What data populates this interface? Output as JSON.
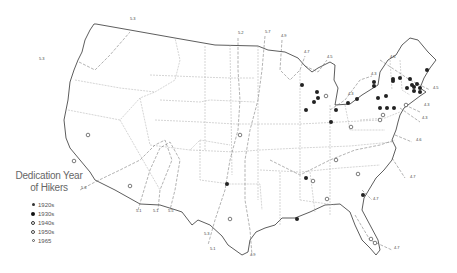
{
  "map": {
    "subject": "Contiguous United States",
    "colors": {
      "coast": "#333333",
      "state": "#999999",
      "isoline": "#666666",
      "marker": "#222222"
    }
  },
  "legend": {
    "title_line1": "Dedication Year",
    "title_line2": "of Hikers",
    "items": [
      {
        "label": "1920s",
        "symbol": "small-filled"
      },
      {
        "label": "1930s",
        "symbol": "filled"
      },
      {
        "label": "1940s",
        "symbol": "ring-thick"
      },
      {
        "label": "1950s",
        "symbol": "ring"
      },
      {
        "label": "1965",
        "symbol": "ring-small"
      }
    ]
  },
  "isoline_labels": [
    {
      "text": "5.3",
      "x": 39,
      "y": 60
    },
    {
      "text": "5.3",
      "x": 130,
      "y": 20
    },
    {
      "text": "5.2",
      "x": 238,
      "y": 34
    },
    {
      "text": "5.7",
      "x": 265,
      "y": 33
    },
    {
      "text": "4.9",
      "x": 281,
      "y": 37
    },
    {
      "text": "4.7",
      "x": 304,
      "y": 53
    },
    {
      "text": "4.5",
      "x": 327,
      "y": 58
    },
    {
      "text": "4.5",
      "x": 390,
      "y": 58
    },
    {
      "text": "4.3",
      "x": 371,
      "y": 75
    },
    {
      "text": "4.5",
      "x": 433,
      "y": 89
    },
    {
      "text": "4.3",
      "x": 348,
      "y": 95
    },
    {
      "text": "4.3",
      "x": 424,
      "y": 106
    },
    {
      "text": "4.3",
      "x": 422,
      "y": 119
    },
    {
      "text": "4.6",
      "x": 416,
      "y": 141
    },
    {
      "text": "4.7",
      "x": 410,
      "y": 178
    },
    {
      "text": "4.7",
      "x": 373,
      "y": 200
    },
    {
      "text": "4.7",
      "x": 394,
      "y": 249
    },
    {
      "text": "4.9",
      "x": 250,
      "y": 256
    },
    {
      "text": "5.3",
      "x": 81,
      "y": 189
    },
    {
      "text": "5.1",
      "x": 136,
      "y": 212
    },
    {
      "text": "5.1",
      "x": 153,
      "y": 212
    },
    {
      "text": "5.5",
      "x": 168,
      "y": 212
    },
    {
      "text": "5.3",
      "x": 204,
      "y": 235
    },
    {
      "text": "5.1",
      "x": 210,
      "y": 250
    }
  ],
  "markers": {
    "filled": [
      [
        302,
        85
      ],
      [
        317,
        92
      ],
      [
        318,
        98
      ],
      [
        314,
        102
      ],
      [
        306,
        110
      ],
      [
        336,
        110
      ],
      [
        331,
        122
      ],
      [
        374,
        82
      ],
      [
        374,
        86
      ],
      [
        393,
        79
      ],
      [
        393,
        81
      ],
      [
        400,
        78
      ],
      [
        410,
        79
      ],
      [
        412,
        85
      ],
      [
        414,
        87
      ],
      [
        417,
        84
      ],
      [
        420,
        88
      ],
      [
        420,
        92
      ],
      [
        414,
        91
      ],
      [
        378,
        98
      ],
      [
        386,
        96
      ],
      [
        407,
        88
      ],
      [
        427,
        70
      ],
      [
        357,
        99
      ],
      [
        348,
        103
      ],
      [
        380,
        108
      ],
      [
        387,
        108
      ],
      [
        394,
        108
      ],
      [
        306,
        178
      ],
      [
        363,
        195
      ],
      [
        297,
        219
      ],
      [
        227,
        184
      ]
    ],
    "ring": [
      [
        326,
        96
      ],
      [
        406,
        105
      ],
      [
        383,
        115
      ],
      [
        380,
        120
      ],
      [
        351,
        127
      ],
      [
        240,
        135
      ],
      [
        336,
        160
      ],
      [
        313,
        181
      ],
      [
        358,
        174
      ],
      [
        327,
        199
      ],
      [
        74,
        161
      ],
      [
        130,
        186
      ],
      [
        88,
        135
      ],
      [
        230,
        219
      ],
      [
        371,
        239
      ],
      [
        375,
        243
      ]
    ]
  }
}
